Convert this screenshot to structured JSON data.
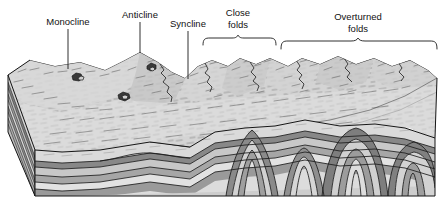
{
  "figure": {
    "background_color": "#ffffff",
    "ink_color": "#1a1a1a",
    "labels": [
      {
        "id": "monocline",
        "text": "Monocline",
        "x": 68,
        "y": 25,
        "annotation": "leader-line"
      },
      {
        "id": "anticline",
        "text": "Anticline",
        "x": 140,
        "y": 18,
        "annotation": "leader-line"
      },
      {
        "id": "syncline",
        "text": "Syncline",
        "x": 188,
        "y": 27,
        "annotation": "leader-line"
      },
      {
        "id": "close-folds-1",
        "text": "Close",
        "x": 238,
        "y": 16,
        "annotation": "bracket"
      },
      {
        "id": "close-folds-2",
        "text": "folds",
        "x": 238,
        "y": 28,
        "annotation": "bracket"
      },
      {
        "id": "overturned-folds-1",
        "text": "Overturned",
        "x": 358,
        "y": 20,
        "annotation": "bracket"
      },
      {
        "id": "overturned-folds-2",
        "text": "folds",
        "x": 358,
        "y": 32,
        "annotation": "bracket"
      }
    ],
    "leaders": [
      {
        "id": "monocline-leader",
        "x": 68,
        "y1": 29,
        "y2": 69
      },
      {
        "id": "anticline-leader",
        "x": 140,
        "y1": 22,
        "y2": 53
      },
      {
        "id": "syncline-leader",
        "x": 188,
        "y1": 31,
        "y2": 79
      }
    ],
    "brackets": [
      {
        "id": "close-folds-bracket",
        "x1": 203,
        "x2": 276,
        "mid": 238,
        "y": 44,
        "tip": 37
      },
      {
        "id": "overturned-folds-bracket",
        "x1": 281,
        "x2": 437,
        "mid": 358,
        "y": 47,
        "tip": 39
      }
    ],
    "strata": {
      "band_colors": [
        "#d9d9d9",
        "#8e8e8e",
        "#c6c6c6",
        "#a8a8a8",
        "#e0e0e0",
        "#9a9a9a",
        "#cfcfcf",
        "#b5b5b5"
      ],
      "surface_color": "#d2d2d2",
      "side_light": "#c2c2c2",
      "side_dark": "#7d7d7d",
      "band_count": 8
    },
    "structures": [
      {
        "name": "monocline",
        "kind": "fold",
        "position": "left"
      },
      {
        "name": "anticline",
        "kind": "fold",
        "position": "left-center"
      },
      {
        "name": "syncline",
        "kind": "fold",
        "position": "center"
      },
      {
        "name": "close folds",
        "kind": "fold-set",
        "position": "center-right"
      },
      {
        "name": "overturned folds",
        "kind": "fold-set",
        "position": "right"
      }
    ]
  }
}
